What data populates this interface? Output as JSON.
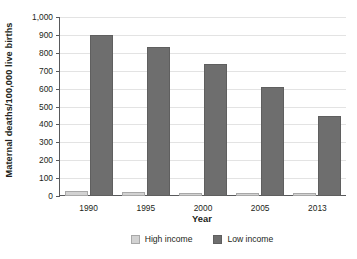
{
  "chart_data": {
    "type": "bar",
    "title": "",
    "xlabel": "Year",
    "ylabel": "Maternal deaths/100,000 live births",
    "categories": [
      "1990",
      "1995",
      "2000",
      "2005",
      "2013"
    ],
    "series": [
      {
        "name": "High income",
        "color": "#d2d2d2",
        "values": [
          26,
          22,
          19,
          16,
          17
        ]
      },
      {
        "name": "Low income",
        "color": "#6e6e6e",
        "values": [
          900,
          835,
          735,
          608,
          445
        ]
      }
    ],
    "ylim": [
      0,
      1000
    ],
    "yticks": [
      0,
      100,
      200,
      300,
      400,
      500,
      600,
      700,
      800,
      900,
      1000
    ],
    "ytick_labels": [
      "0",
      "100",
      "200",
      "300",
      "400",
      "500",
      "600",
      "700",
      "800",
      "900",
      "1,000"
    ],
    "grid": true,
    "legend_position": "bottom"
  }
}
